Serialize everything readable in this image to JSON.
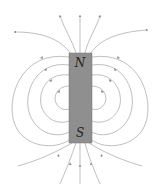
{
  "diagram": {
    "magnet": {
      "north_label": "N",
      "south_label": "S",
      "fill_color": "#8f8f8f",
      "border_color": "#777777"
    },
    "field_line_color": "#9a9a9a",
    "field_direction": "out of N, into S"
  }
}
